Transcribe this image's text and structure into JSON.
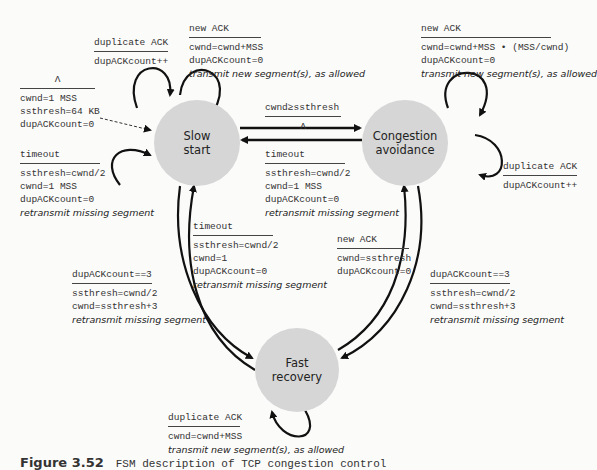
{
  "states": {
    "slow_start": "Slow\nstart",
    "congestion_avoidance": "Congestion\navoidance",
    "fast_recovery": "Fast\nrecovery"
  },
  "transitions": {
    "init": {
      "event": "Λ",
      "actions": [
        "cwnd=1 MSS",
        "ssthresh=64 KB",
        "dupACKcount=0"
      ]
    },
    "ss_dup_ack": {
      "event": "duplicate ACK",
      "actions": [
        "dupACKcount++"
      ]
    },
    "ss_new_ack": {
      "event": "new ACK",
      "actions": [
        "cwnd=cwnd+MSS",
        "dupACKcount=0"
      ],
      "italic": "transmit new segment(s), as allowed"
    },
    "ss_timeout": {
      "event": "timeout",
      "actions": [
        "ssthresh=cwnd/2",
        "cwnd=1 MSS",
        "dupACKcount=0"
      ],
      "italic": "retransmit missing segment"
    },
    "ss_to_ca": {
      "event": "cwnd≥ssthresh",
      "actions": [
        "Λ"
      ]
    },
    "ca_to_ss_timeout": {
      "event": "timeout",
      "actions": [
        "ssthresh=cwnd/2",
        "cwnd=1 MSS",
        "dupACKcount=0"
      ],
      "italic": "retransmit missing segment"
    },
    "ca_new_ack": {
      "event": "new ACK",
      "actions": [
        "cwnd=cwnd+MSS • (MSS/cwnd)",
        "dupACKcount=0"
      ],
      "italic": "transmit new segment(s), as allowed"
    },
    "ca_dup_ack": {
      "event": "duplicate ACK",
      "actions": [
        "dupACKcount++"
      ]
    },
    "fr_to_ss_timeout": {
      "event": "timeout",
      "actions": [
        "ssthresh=cwnd/2",
        "cwnd=1",
        "dupACKcount=0"
      ],
      "italic": "retransmit missing segment"
    },
    "fr_to_ca_new_ack": {
      "event": "new ACK",
      "actions": [
        "cwnd=ssthresh",
        "dupACKcount=0"
      ]
    },
    "ss_to_fr": {
      "event": "dupACKcount==3",
      "actions": [
        "ssthresh=cwnd/2",
        "cwnd=ssthresh+3"
      ],
      "italic": "retransmit missing segment"
    },
    "ca_to_fr": {
      "event": "dupACKcount==3",
      "actions": [
        "ssthresh=cwnd/2",
        "cwnd=ssthresh+3"
      ],
      "italic": "retransmit missing segment"
    },
    "fr_dup_ack": {
      "event": "duplicate ACK",
      "actions": [
        "cwnd=cwnd+MSS"
      ],
      "italic": "transmit new segment(s), as allowed"
    }
  },
  "caption": {
    "label": "Figure 3.52",
    "text": "FSM description of TCP congestion control"
  }
}
